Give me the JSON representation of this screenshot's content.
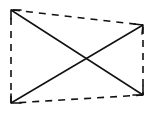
{
  "diagram": {
    "stroke_color": "#111111",
    "background_color": "#ffffff",
    "vertices": {
      "top_left": [
        11,
        10
      ],
      "top_right": [
        143,
        25
      ],
      "bottom_right": [
        143,
        95
      ],
      "bottom_left": [
        11,
        103
      ]
    },
    "edges": [
      {
        "name": "top-edge",
        "from": "top_left",
        "to": "top_right",
        "style": "dashed"
      },
      {
        "name": "right-edge",
        "from": "top_right",
        "to": "bottom_right",
        "style": "dashed"
      },
      {
        "name": "bottom-edge",
        "from": "bottom_right",
        "to": "bottom_left",
        "style": "dashed"
      },
      {
        "name": "left-edge",
        "from": "bottom_left",
        "to": "top_left",
        "style": "dashed"
      }
    ],
    "diagonals": [
      {
        "name": "diagonal-tl-br",
        "from": "top_left",
        "to": "bottom_right",
        "style": "solid",
        "arrowheads": [
          "top_left",
          "bottom_right"
        ]
      },
      {
        "name": "diagonal-bl-tr",
        "from": "bottom_left",
        "to": "top_right",
        "style": "solid",
        "arrowheads": [
          "bottom_left",
          "top_right"
        ]
      }
    ],
    "intersection": [
      87,
      59
    ]
  }
}
